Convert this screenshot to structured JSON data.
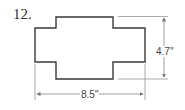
{
  "problem": {
    "number": "12."
  },
  "figure": {
    "shape": "cross-shaped polygon (rectangle with notched corners)",
    "dimensions": {
      "height_label": "4.7\"",
      "width_label": "8.5\""
    },
    "colors": {
      "outline": "#3a3a3a",
      "dimension_line": "#777777"
    }
  }
}
